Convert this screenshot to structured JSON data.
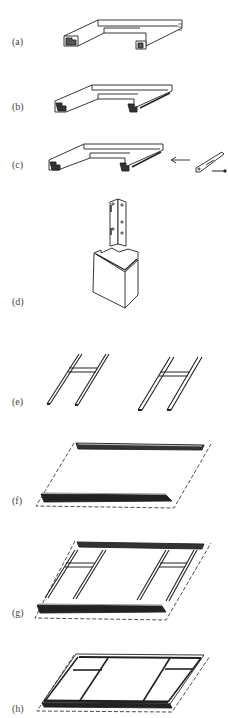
{
  "figure": {
    "steps": [
      {
        "label": "(a)",
        "description": "U-shaped frame with end profiles"
      },
      {
        "label": "(b)",
        "description": "U-shaped frame with grooved profile"
      },
      {
        "label": "(c)",
        "description": "Frame with corner bracket and screw being attached"
      },
      {
        "label": "(d)",
        "description": "Bracket above corner block"
      },
      {
        "label": "(e)",
        "description": "Two H-shaped ladder frames"
      },
      {
        "label": "(f)",
        "description": "Two long rails on dashed outline"
      },
      {
        "label": "(g)",
        "description": "Rails with H-frames placed on outline"
      },
      {
        "label": "(h)",
        "description": "Assembled rectangular frame"
      }
    ]
  }
}
